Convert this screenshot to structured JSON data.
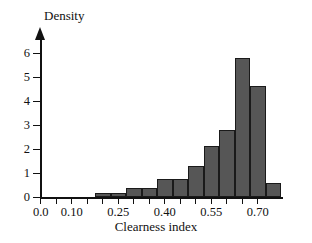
{
  "chart_data": {
    "type": "bar",
    "title": "",
    "xlabel": "Clearness index",
    "ylabel": "Density",
    "xlim": [
      0.0,
      0.775
    ],
    "ylim": [
      0,
      6.4
    ],
    "grid": false,
    "legend": null,
    "bar_color": "#565656",
    "bar_edge_color": "#1a1a1a",
    "axis_color": "#111111",
    "bin_width": 0.05,
    "x_ticks": [
      {
        "value": 0.0,
        "label": "0.0"
      },
      {
        "value": 0.05,
        "label": ""
      },
      {
        "value": 0.1,
        "label": "0.10"
      },
      {
        "value": 0.15,
        "label": ""
      },
      {
        "value": 0.2,
        "label": ""
      },
      {
        "value": 0.25,
        "label": "0.25"
      },
      {
        "value": 0.3,
        "label": ""
      },
      {
        "value": 0.35,
        "label": ""
      },
      {
        "value": 0.4,
        "label": "0.40"
      },
      {
        "value": 0.45,
        "label": ""
      },
      {
        "value": 0.5,
        "label": ""
      },
      {
        "value": 0.55,
        "label": "0.55"
      },
      {
        "value": 0.6,
        "label": ""
      },
      {
        "value": 0.65,
        "label": ""
      },
      {
        "value": 0.7,
        "label": "0.70"
      }
    ],
    "y_ticks": [
      {
        "value": 0,
        "label": "0"
      },
      {
        "value": 1,
        "label": "1"
      },
      {
        "value": 2,
        "label": "2"
      },
      {
        "value": 3,
        "label": "3"
      },
      {
        "value": 4,
        "label": "4"
      },
      {
        "value": 5,
        "label": "5"
      },
      {
        "value": 6,
        "label": "6"
      }
    ],
    "bins": [
      {
        "x0": 0.175,
        "x1": 0.225,
        "density": 0.2
      },
      {
        "x0": 0.225,
        "x1": 0.275,
        "density": 0.2
      },
      {
        "x0": 0.275,
        "x1": 0.325,
        "density": 0.4
      },
      {
        "x0": 0.325,
        "x1": 0.375,
        "density": 0.4
      },
      {
        "x0": 0.375,
        "x1": 0.425,
        "density": 0.78
      },
      {
        "x0": 0.425,
        "x1": 0.475,
        "density": 0.78
      },
      {
        "x0": 0.475,
        "x1": 0.525,
        "density": 1.32
      },
      {
        "x0": 0.525,
        "x1": 0.575,
        "density": 2.15
      },
      {
        "x0": 0.575,
        "x1": 0.625,
        "density": 2.82
      },
      {
        "x0": 0.625,
        "x1": 0.675,
        "density": 5.8
      },
      {
        "x0": 0.675,
        "x1": 0.725,
        "density": 4.65
      },
      {
        "x0": 0.725,
        "x1": 0.775,
        "density": 0.62
      }
    ]
  }
}
